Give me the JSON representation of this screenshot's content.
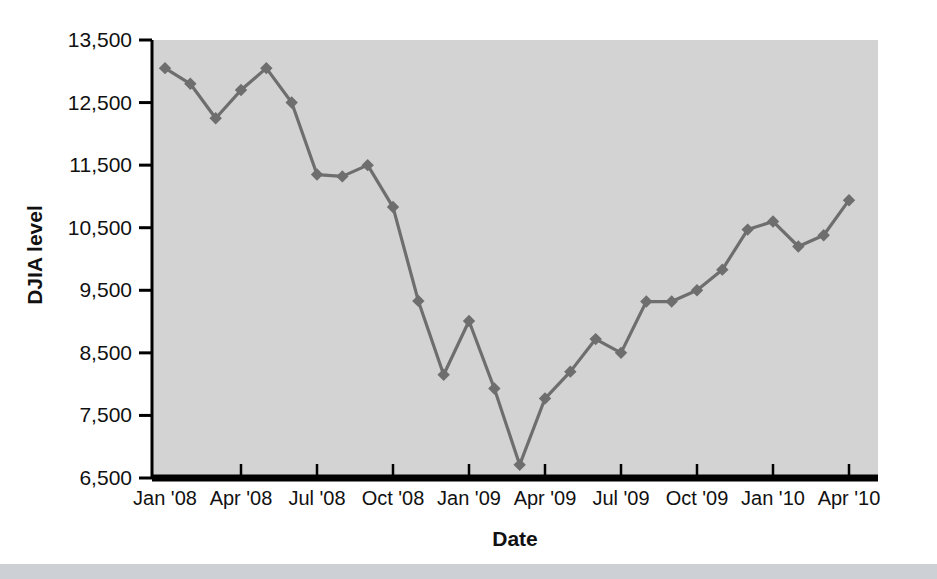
{
  "figure": {
    "background_color": "#ffffff",
    "plot_background_color": "#d3d3d3",
    "axis_color": "#000000",
    "series_color": "#6e6e6e",
    "bottom_band_color": "#cdd0d4"
  },
  "chart_data": {
    "type": "line",
    "title": "",
    "xlabel": "Date",
    "ylabel": "DJIA level",
    "ylim": [
      6500,
      13500
    ],
    "yticks": [
      6500,
      7500,
      8500,
      9500,
      10500,
      11500,
      12500,
      13500
    ],
    "ytick_labels": [
      "6,500",
      "7,500",
      "8,500",
      "9,500",
      "10,500",
      "11,500",
      "12,500",
      "13,500"
    ],
    "xtick_labels": [
      "Jan '08",
      "Apr '08",
      "Jul '08",
      "Oct '08",
      "Jan '09",
      "Apr '09",
      "Jul '09",
      "Oct '09",
      "Jan '10",
      "Apr '10"
    ],
    "xtick_indices": [
      0,
      3,
      6,
      9,
      12,
      15,
      18,
      21,
      24,
      27
    ],
    "grid": false,
    "legend": "none",
    "marker": "diamond",
    "x": [
      "Jan '08",
      "Feb '08",
      "Mar '08",
      "Apr '08",
      "May '08",
      "Jun '08",
      "Jul '08",
      "Aug '08",
      "Sep '08",
      "Oct '08",
      "Nov '08",
      "Dec '08",
      "Jan '09",
      "Feb '09",
      "Mar '09",
      "Apr '09",
      "May '09",
      "Jun '09",
      "Jul '09",
      "Aug '09",
      "Sep '09",
      "Oct '09",
      "Nov '09",
      "Dec '09",
      "Jan '10",
      "Feb '10",
      "Mar '10",
      "Apr '10"
    ],
    "values": [
      13050,
      12800,
      12250,
      12700,
      13050,
      12500,
      11350,
      11320,
      11500,
      10830,
      9330,
      8150,
      9010,
      7930,
      6710,
      7770,
      8200,
      8720,
      8500,
      9320,
      9320,
      9500,
      9830,
      10470,
      10600,
      10200,
      10380,
      10940
    ],
    "series_name": "DJIA level"
  }
}
